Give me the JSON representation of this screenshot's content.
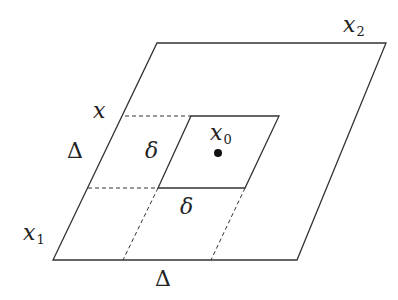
{
  "diagram": {
    "colors": {
      "line": "#333333",
      "point": "#111111",
      "background": "#ffffff"
    },
    "labels": {
      "x2": {
        "base": "x",
        "sub": "2"
      },
      "x": {
        "base": "x"
      },
      "x0": {
        "base": "x",
        "sub": "0"
      },
      "x1": {
        "base": "x",
        "sub": "1"
      },
      "delta_left": "Δ",
      "delta_bottom": "Δ",
      "small_delta_left": "δ",
      "small_delta_bottom": "δ"
    }
  }
}
